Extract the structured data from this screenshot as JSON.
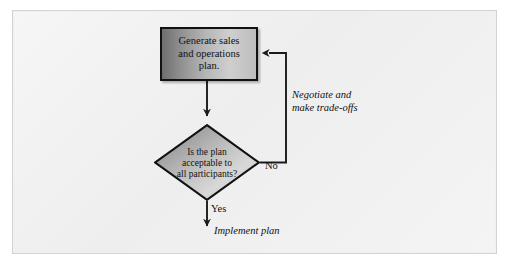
{
  "diagram": {
    "frame": {
      "border_color": "#d3d3d3",
      "background_color": "#f2f2f2"
    },
    "nodes": {
      "process": {
        "type": "process",
        "text": "Generate sales\nand operations\nplan.",
        "line1": "Generate sales",
        "line2": "and operations",
        "line3": "plan.",
        "fill_start": "#6e6e6e",
        "fill_end": "#cfcfcf",
        "border_color": "#111111"
      },
      "decision": {
        "type": "decision",
        "text": "Is the plan\nacceptable to\nall participants?",
        "line1": "Is the plan",
        "line2": "acceptable to",
        "line3": "all participants?",
        "fill_start": "#787878",
        "fill_end": "#d8d8d8",
        "border_color": "#111111"
      }
    },
    "edges": [
      {
        "id": "process-to-decision",
        "from": "process",
        "to": "decision",
        "label": "",
        "direction": "down"
      },
      {
        "id": "decision-no-loop",
        "from": "decision",
        "to": "process",
        "label": "No",
        "annotation_line1": "Negotiate and",
        "annotation_line2": "make trade-offs",
        "direction": "right-up-left"
      },
      {
        "id": "decision-yes-exit",
        "from": "decision",
        "to": "implement",
        "label": "Yes",
        "annotation": "Implement plan",
        "direction": "down"
      }
    ],
    "labels": {
      "no": "No",
      "yes": "Yes",
      "negotiate_line1": "Negotiate and",
      "negotiate_line2": "make trade-offs",
      "implement_plan": "Implement plan"
    },
    "line_color": "#1a1a1a"
  }
}
